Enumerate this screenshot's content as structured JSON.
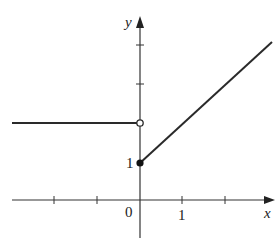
{
  "figure": {
    "axes": {
      "x_label": "x",
      "y_label": "y",
      "origin_label": "0",
      "x_tick_label": "1",
      "y_tick_label": "1"
    },
    "pieces": [
      {
        "name": "left-constant",
        "type": "horizontal-segment",
        "y_value": 2,
        "x_range": "x < 0",
        "endpoint": "open circle at (0, 2)"
      },
      {
        "name": "right-linear",
        "type": "ray",
        "from": [
          0,
          1
        ],
        "slope": "approx 1.15 (per units)",
        "endpoint": "filled dot at (0, 1)"
      }
    ],
    "colors": {
      "axis": "#333333",
      "curve": "#2a2a2a",
      "background": "#ffffff"
    }
  }
}
